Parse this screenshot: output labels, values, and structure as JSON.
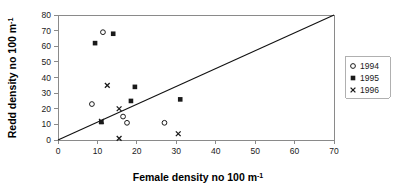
{
  "chart_data": {
    "type": "scatter",
    "title": "",
    "xlabel": "Female density no 100 m",
    "xlabel_sup": "-1",
    "ylabel": "Redd density no 100 m",
    "ylabel_sup": "-1",
    "xlim": [
      0,
      70
    ],
    "ylim": [
      0,
      80
    ],
    "xticks": [
      0,
      10,
      20,
      30,
      40,
      50,
      60,
      70
    ],
    "yticks": [
      0,
      10,
      20,
      30,
      40,
      50,
      60,
      70,
      80
    ],
    "grid": false,
    "legend_position": "right",
    "series": [
      {
        "name": "1994",
        "marker": "open-circle",
        "color": "#1a1a1a",
        "points": [
          {
            "x": 11.4,
            "y": 69
          },
          {
            "x": 8.6,
            "y": 23
          },
          {
            "x": 16.5,
            "y": 15
          },
          {
            "x": 17.5,
            "y": 11
          },
          {
            "x": 27.0,
            "y": 11
          }
        ]
      },
      {
        "name": "1995",
        "marker": "filled-square",
        "color": "#1a1a1a",
        "points": [
          {
            "x": 9.4,
            "y": 62
          },
          {
            "x": 14.0,
            "y": 68
          },
          {
            "x": 19.5,
            "y": 34
          },
          {
            "x": 18.5,
            "y": 25
          },
          {
            "x": 31.0,
            "y": 26
          },
          {
            "x": 11.0,
            "y": 11.5
          }
        ]
      },
      {
        "name": "1996",
        "marker": "cross-x",
        "color": "#1a1a1a",
        "points": [
          {
            "x": 12.5,
            "y": 35
          },
          {
            "x": 15.5,
            "y": 20
          },
          {
            "x": 11.0,
            "y": 12
          },
          {
            "x": 15.5,
            "y": 1
          },
          {
            "x": 30.5,
            "y": 4
          }
        ]
      }
    ],
    "reference_line": {
      "name": "one-to-one-line",
      "from": {
        "x": 0,
        "y": 0
      },
      "to": {
        "x": 70,
        "y": 80
      }
    }
  },
  "legend": {
    "entries": [
      {
        "label": "1994",
        "marker": "open-circle"
      },
      {
        "label": "1995",
        "marker": "filled-square"
      },
      {
        "label": "1996",
        "marker": "cross-x"
      }
    ]
  }
}
